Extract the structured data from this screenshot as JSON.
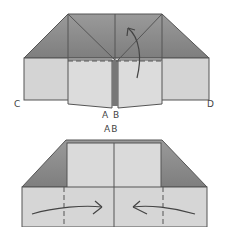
{
  "diagram": {
    "type": "origami-fold-steps",
    "steps": [
      {
        "name": "step-1",
        "labels": {
          "corner_left": "C",
          "corner_right": "D",
          "bottom_center": "A B"
        },
        "arrow": "fold-up"
      },
      {
        "name": "step-2",
        "labels": {
          "top_center": "AB"
        },
        "arrows": [
          "push-in-left",
          "push-in-right"
        ]
      }
    ],
    "colors": {
      "dark_paper": "#8f8f8f",
      "light_paper": "#d6d6d6",
      "line": "#555555",
      "background": "#ffffff"
    }
  }
}
